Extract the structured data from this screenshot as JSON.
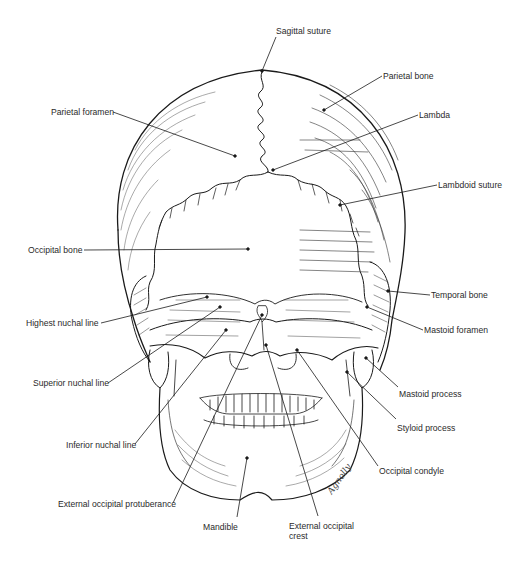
{
  "figure": {
    "signature": "Agnolly",
    "caption_visible": false
  },
  "labels": [
    {
      "id": "sagittal-suture",
      "text": "Sagittal suture",
      "x": 276,
      "y": 31,
      "anchor": [
        262,
        71
      ],
      "from": [
        276,
        37
      ]
    },
    {
      "id": "parietal-bone",
      "text": "Parietal bone",
      "x": 383,
      "y": 71,
      "anchor": [
        324,
        110
      ],
      "from": [
        382,
        76
      ]
    },
    {
      "id": "parietal-foramen",
      "text": "Parietal foramen",
      "x": 51,
      "y": 107,
      "anchor": [
        235,
        156
      ],
      "from": [
        113,
        112
      ]
    },
    {
      "id": "lambda",
      "text": "Lambda",
      "x": 419,
      "y": 110,
      "anchor": [
        273,
        170
      ],
      "from": [
        418,
        115
      ]
    },
    {
      "id": "lambdoid-suture",
      "text": "Lambdoid suture",
      "x": 438,
      "y": 180,
      "anchor": [
        340,
        205
      ],
      "from": [
        437,
        185
      ]
    },
    {
      "id": "occipital-bone",
      "text": "Occipital bone",
      "x": 28,
      "y": 245,
      "anchor": [
        248,
        249
      ],
      "from": [
        84,
        250
      ]
    },
    {
      "id": "temporal-bone",
      "text": "Temporal bone",
      "x": 431,
      "y": 290,
      "anchor": [
        388,
        291
      ],
      "from": [
        430,
        295
      ]
    },
    {
      "id": "highest-nuchal-line",
      "text": "Highest nuchal line",
      "x": 26,
      "y": 318,
      "anchor": [
        207,
        297
      ],
      "from": [
        101,
        323
      ]
    },
    {
      "id": "mastoid-foramen",
      "text": "Mastoid foramen",
      "x": 424,
      "y": 325,
      "anchor": [
        367,
        307
      ],
      "from": [
        423,
        330
      ]
    },
    {
      "id": "superior-nuchal-line",
      "text": "Superior nuchal line",
      "x": 33,
      "y": 378,
      "anchor": [
        220,
        307
      ],
      "from": [
        108,
        383
      ]
    },
    {
      "id": "mastoid-process",
      "text": "Mastoid process",
      "x": 399,
      "y": 389,
      "anchor": [
        366,
        358
      ],
      "from": [
        398,
        387
      ]
    },
    {
      "id": "styloid-process",
      "text": "Styloid process",
      "x": 397,
      "y": 423,
      "anchor": [
        347,
        372
      ],
      "from": [
        396,
        419
      ]
    },
    {
      "id": "inferior-nuchal-line",
      "text": "Inferior nuchal line",
      "x": 66,
      "y": 440,
      "anchor": [
        226,
        330
      ],
      "from": [
        135,
        444
      ]
    },
    {
      "id": "occipital-condyle",
      "text": "Occipital condyle",
      "x": 379,
      "y": 466,
      "anchor": [
        297,
        350
      ],
      "from": [
        378,
        466
      ]
    },
    {
      "id": "external-occipital-protuberance",
      "text": "External occipital protuberance",
      "x": 58,
      "y": 499,
      "anchor": [
        262,
        315
      ],
      "from": [
        173,
        503
      ]
    },
    {
      "id": "mandible",
      "text": "Mandible",
      "x": 203,
      "y": 522,
      "anchor": [
        247,
        458
      ],
      "from": [
        237,
        517
      ]
    },
    {
      "id": "external-occipital-crest",
      "text": "External occipital crest",
      "x": 289,
      "y": 521,
      "anchor": [
        266,
        345
      ],
      "from": [
        318,
        516
      ]
    }
  ]
}
